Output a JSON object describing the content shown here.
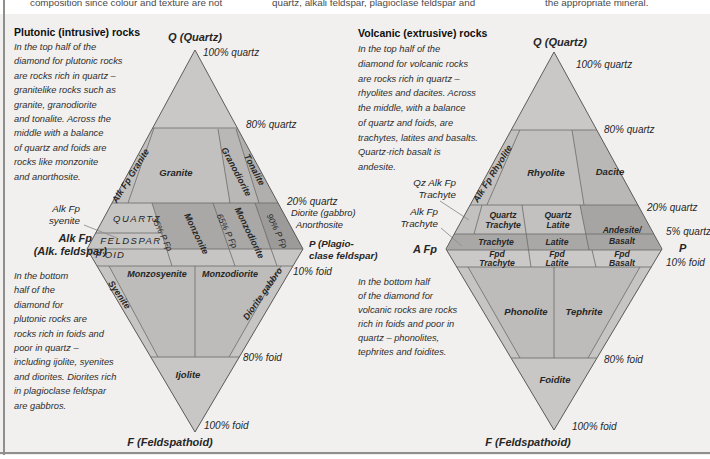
{
  "colors": {
    "figure_bg": "#f1f0ee",
    "diamond_base": "#c9c8c6",
    "top_band": "#c2c1bf",
    "cell_mid": "#b9b8b6",
    "cell_dark": "#b0afad",
    "band_light": "#c6c5c3",
    "band_dark": "#a9a8a6",
    "band_darkest": "#9c9b99",
    "andesite_cell": "#a6a5a3",
    "foot_row": "#cac9c7",
    "bottom_half": "#bdbcba",
    "edge_strip": "#c6c5c3",
    "apex_tri": "#c8c7c5"
  },
  "top_fragments": [
    {
      "n": "fragment-col1",
      "t": "composition since colour and texture are not",
      "x": 30,
      "y": 3,
      "s": 9.8,
      "i": false,
      "c": "#4a4a4a"
    },
    {
      "n": "fragment-col2",
      "t": "quartz, alkali feldspar, plagioclase feldspar and",
      "x": 272,
      "y": 3,
      "s": 9.8,
      "i": false,
      "c": "#4a4a4a"
    },
    {
      "n": "fragment-col3",
      "t": "the appropriate mineral.",
      "x": 545,
      "y": 3,
      "s": 9.8,
      "i": false,
      "c": "#4a4a4a"
    }
  ],
  "plutonic": {
    "texts": [
      {
        "n": "plutonic-heading",
        "t": "Plutonic (intrusive) rocks",
        "x": 14,
        "y": 32,
        "s": 10.5,
        "w": 700,
        "i": false,
        "c": "#0f0f0f"
      },
      {
        "n": "plutonic-intro-line-1",
        "t": "In the top half of the",
        "x": 14,
        "y": 48,
        "s": 9.3,
        "c": "#2e2e2e"
      },
      {
        "n": "plutonic-intro-line-2",
        "t": "diamond for plutonic rocks",
        "x": 14,
        "y": 62.4,
        "s": 9.3,
        "c": "#2e2e2e"
      },
      {
        "n": "plutonic-intro-line-3",
        "t": "are rocks rich in quartz –",
        "x": 14,
        "y": 76.8,
        "s": 9.3,
        "c": "#2e2e2e"
      },
      {
        "n": "plutonic-intro-line-4",
        "t": "granitelike rocks such as",
        "x": 14,
        "y": 91.2,
        "s": 9.3,
        "c": "#2e2e2e"
      },
      {
        "n": "plutonic-intro-line-5",
        "t": "granite, granodiorite",
        "x": 14,
        "y": 105.6,
        "s": 9.3,
        "c": "#2e2e2e"
      },
      {
        "n": "plutonic-intro-line-6",
        "t": "and tonalite. Across the",
        "x": 14,
        "y": 120,
        "s": 9.3,
        "c": "#2e2e2e"
      },
      {
        "n": "plutonic-intro-line-7",
        "t": "middle with a balance",
        "x": 14,
        "y": 134.4,
        "s": 9.3,
        "c": "#2e2e2e"
      },
      {
        "n": "plutonic-intro-line-8",
        "t": "of quartz and foids are",
        "x": 14,
        "y": 148.8,
        "s": 9.3,
        "c": "#2e2e2e"
      },
      {
        "n": "plutonic-intro-line-9",
        "t": "rocks like monzonite",
        "x": 14,
        "y": 163.2,
        "s": 9.3,
        "c": "#2e2e2e"
      },
      {
        "n": "plutonic-intro-line-10",
        "t": "and anorthosite.",
        "x": 14,
        "y": 177.6,
        "s": 9.3,
        "c": "#2e2e2e"
      },
      {
        "n": "plutonic-outro-line-1",
        "t": "In the bottom",
        "x": 14,
        "y": 277,
        "s": 9.3,
        "c": "#2e2e2e"
      },
      {
        "n": "plutonic-outro-line-2",
        "t": "half of the",
        "x": 14,
        "y": 291.4,
        "s": 9.3,
        "c": "#2e2e2e"
      },
      {
        "n": "plutonic-outro-line-3",
        "t": "diamond for",
        "x": 14,
        "y": 305.8,
        "s": 9.3,
        "c": "#2e2e2e"
      },
      {
        "n": "plutonic-outro-line-4",
        "t": "plutonic rocks are",
        "x": 14,
        "y": 320.2,
        "s": 9.3,
        "c": "#2e2e2e"
      },
      {
        "n": "plutonic-outro-line-5",
        "t": "rocks rich in foids and",
        "x": 14,
        "y": 334.6,
        "s": 9.3,
        "c": "#2e2e2e"
      },
      {
        "n": "plutonic-outro-line-6",
        "t": "poor in quartz –",
        "x": 14,
        "y": 349,
        "s": 9.3,
        "c": "#2e2e2e"
      },
      {
        "n": "plutonic-outro-line-7",
        "t": "including ijolite, syenites",
        "x": 14,
        "y": 363.4,
        "s": 9.3,
        "c": "#2e2e2e"
      },
      {
        "n": "plutonic-outro-line-8",
        "t": "and diorites. Diorites rich",
        "x": 14,
        "y": 377.8,
        "s": 9.3,
        "c": "#2e2e2e"
      },
      {
        "n": "plutonic-outro-line-9",
        "t": "in plagioclase feldspar",
        "x": 14,
        "y": 392.2,
        "s": 9.3,
        "c": "#2e2e2e"
      },
      {
        "n": "plutonic-outro-line-10",
        "t": "are gabbros.",
        "x": 14,
        "y": 406.6,
        "s": 9.3,
        "c": "#2e2e2e"
      },
      {
        "n": "plutonic-q-vertex-label",
        "t": "Q (Quartz)",
        "x": 195,
        "y": 37,
        "a": "center",
        "s": 11,
        "w": 700
      },
      {
        "n": "plutonic-100-quartz-label",
        "t": "100% quartz",
        "x": 203,
        "y": 53,
        "s": 10
      },
      {
        "n": "plutonic-80-quartz-label",
        "t": "80% quartz",
        "x": 246,
        "y": 125,
        "s": 10
      },
      {
        "n": "plutonic-20-quartz-label",
        "t": "20% quartz",
        "x": 287,
        "y": 202,
        "s": 10
      },
      {
        "n": "plutonic-diorite-gabbro-note",
        "t": "Diorite (gabbro)",
        "x": 291,
        "y": 214,
        "s": 9.3
      },
      {
        "n": "plutonic-anorthosite-note",
        "t": "Anorthosite",
        "x": 296,
        "y": 226,
        "s": 9.3
      },
      {
        "n": "plutonic-p-vertex-label-1",
        "t": "P (Plagio-",
        "x": 309,
        "y": 244,
        "s": 9.8,
        "w": 700
      },
      {
        "n": "plutonic-p-vertex-label-2",
        "t": "clase feldspar)",
        "x": 309,
        "y": 256,
        "s": 9.8,
        "w": 700
      },
      {
        "n": "plutonic-10-foid-label",
        "t": "10% foid",
        "x": 293,
        "y": 272,
        "s": 10
      },
      {
        "n": "plutonic-80-foid-label",
        "t": "80% foid",
        "x": 243,
        "y": 358,
        "s": 10
      },
      {
        "n": "plutonic-100-foid-label",
        "t": "100% foid",
        "x": 204,
        "y": 426,
        "s": 10
      },
      {
        "n": "plutonic-f-vertex-label",
        "t": "F (Feldspathoid)",
        "x": 170,
        "y": 442,
        "a": "center",
        "s": 11,
        "w": 700
      },
      {
        "n": "plutonic-alkfp-syenite-callout-1",
        "t": "Alk Fp",
        "x": 80,
        "y": 209,
        "a": "right",
        "s": 9.8
      },
      {
        "n": "plutonic-alkfp-syenite-callout-2",
        "t": "syenite",
        "x": 80,
        "y": 221,
        "a": "right",
        "s": 9.8
      },
      {
        "n": "plutonic-a-vertex-label-1",
        "t": "Alk Fp",
        "x": 92,
        "y": 238,
        "a": "right",
        "s": 11,
        "w": 700
      },
      {
        "n": "plutonic-a-vertex-label-2",
        "t": "(Alk. feldspar)",
        "x": 107,
        "y": 251,
        "a": "right",
        "s": 11,
        "w": 700
      },
      {
        "n": "plutonic-quartz-row-label",
        "t": "QUARTZ",
        "x": 137,
        "y": 219,
        "a": "center",
        "s": 9.5,
        "ls": 1.5
      },
      {
        "n": "plutonic-feldspar-row-label",
        "t": "FELDSPAR",
        "x": 131,
        "y": 241,
        "a": "center",
        "s": 9.5,
        "ls": 1.5
      },
      {
        "n": "plutonic-foid-row-label",
        "t": "F'OID",
        "x": 110,
        "y": 255,
        "a": "center",
        "s": 9.5,
        "ls": 1
      },
      {
        "n": "field-alk-fp-granite",
        "t": "Alk Fp Granite",
        "x": 131,
        "y": 176,
        "a": "center",
        "r": -58,
        "s": 9,
        "w": 700
      },
      {
        "n": "field-granite",
        "t": "Granite",
        "x": 176,
        "y": 173,
        "a": "center",
        "s": 9.5,
        "w": 700
      },
      {
        "n": "field-granodiorite",
        "t": "Granodiorite",
        "x": 236,
        "y": 172,
        "a": "center",
        "r": 62,
        "s": 9,
        "w": 700
      },
      {
        "n": "field-tonalite",
        "t": "Tonalite",
        "x": 254,
        "y": 170,
        "a": "center",
        "r": 62,
        "s": 9,
        "w": 700
      },
      {
        "n": "boundary-35-p-fp",
        "t": "35% P Fp",
        "x": 162,
        "y": 234,
        "a": "center",
        "r": 64,
        "s": 8.5
      },
      {
        "n": "field-monzonite",
        "t": "Monzonite",
        "x": 196,
        "y": 234,
        "a": "center",
        "r": 64,
        "s": 9,
        "w": 700
      },
      {
        "n": "boundary-65-p-fp",
        "t": "65% P Fp",
        "x": 227,
        "y": 231,
        "a": "center",
        "r": 64,
        "s": 8.5
      },
      {
        "n": "field-monzodiorite-band",
        "t": "Monzodiorite",
        "x": 249,
        "y": 233,
        "a": "center",
        "r": 64,
        "s": 9,
        "w": 700
      },
      {
        "n": "boundary-90-p-fp",
        "t": "90% P Fp",
        "x": 277,
        "y": 231,
        "a": "center",
        "r": 64,
        "s": 8.5
      },
      {
        "n": "field-syenite",
        "t": "Syenite",
        "x": 119,
        "y": 295,
        "a": "center",
        "r": 55,
        "s": 9,
        "w": 700
      },
      {
        "n": "field-monzosyenite",
        "t": "Monzosyenite",
        "x": 157,
        "y": 274,
        "a": "center",
        "s": 9,
        "w": 700
      },
      {
        "n": "field-monzodiorite-row",
        "t": "Monzodiorite",
        "x": 230,
        "y": 274,
        "a": "center",
        "s": 9,
        "w": 700
      },
      {
        "n": "field-diorite-gabbro",
        "t": "Diorite gabbro",
        "x": 263,
        "y": 294,
        "a": "center",
        "r": -55,
        "s": 9,
        "w": 700
      },
      {
        "n": "field-ijolite",
        "t": "Ijolite",
        "x": 188,
        "y": 375,
        "a": "center",
        "s": 9.5,
        "w": 700
      }
    ]
  },
  "volcanic": {
    "texts": [
      {
        "n": "volcanic-heading",
        "t": "Volcanic (extrusive) rocks",
        "x": 358,
        "y": 33,
        "s": 10.5,
        "w": 700,
        "i": false,
        "c": "#0f0f0f"
      },
      {
        "n": "volcanic-intro-line-1",
        "t": "In the top half of the",
        "x": 358,
        "y": 50,
        "s": 9.3,
        "c": "#2e2e2e"
      },
      {
        "n": "volcanic-intro-line-2",
        "t": "diamond for volcanic rocks",
        "x": 358,
        "y": 64.8,
        "s": 9.3,
        "c": "#2e2e2e"
      },
      {
        "n": "volcanic-intro-line-3",
        "t": "are rocks rich in quartz –",
        "x": 358,
        "y": 79.5,
        "s": 9.3,
        "c": "#2e2e2e"
      },
      {
        "n": "volcanic-intro-line-4",
        "t": "rhyolites and dacites. Across",
        "x": 358,
        "y": 94.3,
        "s": 9.3,
        "c": "#2e2e2e"
      },
      {
        "n": "volcanic-intro-line-5",
        "t": "the middle, with a balance",
        "x": 358,
        "y": 109,
        "s": 9.3,
        "c": "#2e2e2e"
      },
      {
        "n": "volcanic-intro-line-6",
        "t": "of quartz and foids, are",
        "x": 358,
        "y": 123.8,
        "s": 9.3,
        "c": "#2e2e2e"
      },
      {
        "n": "volcanic-intro-line-7",
        "t": "trachytes, latites and basalts.",
        "x": 358,
        "y": 138.5,
        "s": 9.3,
        "c": "#2e2e2e"
      },
      {
        "n": "volcanic-intro-line-8",
        "t": "Quartz-rich basalt is",
        "x": 358,
        "y": 153.3,
        "s": 9.3,
        "c": "#2e2e2e"
      },
      {
        "n": "volcanic-intro-line-9",
        "t": "andesite.",
        "x": 358,
        "y": 168,
        "s": 9.3,
        "c": "#2e2e2e"
      },
      {
        "n": "volcanic-outro-line-1",
        "t": "In the bottom half",
        "x": 358,
        "y": 283,
        "s": 9.3,
        "c": "#2e2e2e"
      },
      {
        "n": "volcanic-outro-line-2",
        "t": "of the diamond for",
        "x": 358,
        "y": 297,
        "s": 9.3,
        "c": "#2e2e2e"
      },
      {
        "n": "volcanic-outro-line-3",
        "t": "volcanic rocks are rocks",
        "x": 358,
        "y": 311,
        "s": 9.3,
        "c": "#2e2e2e"
      },
      {
        "n": "volcanic-outro-line-4",
        "t": "rich in foids and poor in",
        "x": 358,
        "y": 325,
        "s": 9.3,
        "c": "#2e2e2e"
      },
      {
        "n": "volcanic-outro-line-5",
        "t": "quartz – phonolites,",
        "x": 358,
        "y": 339,
        "s": 9.3,
        "c": "#2e2e2e"
      },
      {
        "n": "volcanic-outro-line-6",
        "t": "tephrites and foidites.",
        "x": 358,
        "y": 353,
        "s": 9.3,
        "c": "#2e2e2e"
      },
      {
        "n": "volcanic-q-vertex-label",
        "t": "Q (Quartz)",
        "x": 560,
        "y": 42,
        "a": "center",
        "s": 11,
        "w": 700
      },
      {
        "n": "volcanic-100-quartz-label",
        "t": "100% quartz",
        "x": 576,
        "y": 65,
        "s": 10
      },
      {
        "n": "volcanic-80-quartz-label",
        "t": "80% quartz",
        "x": 604,
        "y": 130,
        "s": 10
      },
      {
        "n": "volcanic-20-quartz-label",
        "t": "20% quartz",
        "x": 647,
        "y": 208,
        "s": 10
      },
      {
        "n": "volcanic-5-quartz-label",
        "t": "5% quartz",
        "x": 666,
        "y": 232,
        "s": 10
      },
      {
        "n": "volcanic-p-vertex-label",
        "t": "P",
        "x": 679,
        "y": 248,
        "s": 11,
        "w": 700
      },
      {
        "n": "volcanic-10-foid-label",
        "t": "10% foid",
        "x": 666,
        "y": 263,
        "s": 10
      },
      {
        "n": "volcanic-80-foid-label",
        "t": "80% foid",
        "x": 604,
        "y": 360,
        "s": 10
      },
      {
        "n": "volcanic-100-foid-label",
        "t": "100% foid",
        "x": 572,
        "y": 427,
        "s": 10
      },
      {
        "n": "volcanic-f-vertex-label",
        "t": "F (Feldspathoid)",
        "x": 528,
        "y": 442,
        "a": "center",
        "s": 11,
        "w": 700
      },
      {
        "n": "volcanic-qz-alk-fp-callout-1",
        "t": "Qz Alk Fp",
        "x": 456,
        "y": 183,
        "a": "right",
        "s": 9.8
      },
      {
        "n": "volcanic-qz-alk-fp-callout-2",
        "t": "Trachyte",
        "x": 456,
        "y": 195,
        "a": "right",
        "s": 9.8
      },
      {
        "n": "volcanic-alk-fp-callout-1",
        "t": "Alk Fp",
        "x": 438,
        "y": 212,
        "a": "right",
        "s": 9.8
      },
      {
        "n": "volcanic-alk-fp-callout-2",
        "t": "Trachyte",
        "x": 438,
        "y": 224,
        "a": "right",
        "s": 9.8
      },
      {
        "n": "volcanic-a-vertex-label",
        "t": "A Fp",
        "x": 437,
        "y": 249,
        "a": "right",
        "s": 11,
        "w": 700
      },
      {
        "n": "field-alk-fp-rhyolite",
        "t": "Alk Fp Rhyolite",
        "x": 493,
        "y": 174,
        "a": "center",
        "r": -58,
        "s": 9,
        "w": 700
      },
      {
        "n": "field-rhyolite",
        "t": "Rhyolite",
        "x": 546,
        "y": 173,
        "a": "center",
        "s": 9.5,
        "w": 700
      },
      {
        "n": "field-dacite",
        "t": "Dacite",
        "x": 610,
        "y": 172,
        "a": "center",
        "s": 9.5,
        "w": 700
      },
      {
        "n": "field-quartz-trachyte-1",
        "t": "Quartz",
        "x": 503,
        "y": 215,
        "a": "center",
        "s": 8.6,
        "w": 700
      },
      {
        "n": "field-quartz-trachyte-2",
        "t": "Trachyte",
        "x": 503,
        "y": 225,
        "a": "center",
        "s": 8.6,
        "w": 700
      },
      {
        "n": "field-quartz-latite-1",
        "t": "Quartz",
        "x": 558,
        "y": 215,
        "a": "center",
        "s": 8.6,
        "w": 700
      },
      {
        "n": "field-quartz-latite-2",
        "t": "Latite",
        "x": 558,
        "y": 225,
        "a": "center",
        "s": 8.6,
        "w": 700
      },
      {
        "n": "field-andesite-basalt-1",
        "t": "Andesite/",
        "x": 622,
        "y": 230,
        "a": "center",
        "s": 8.6,
        "w": 700
      },
      {
        "n": "field-andesite-basalt-2",
        "t": "Basalt",
        "x": 622,
        "y": 241,
        "a": "center",
        "s": 8.6,
        "w": 700
      },
      {
        "n": "field-trachyte",
        "t": "Trachyte",
        "x": 496,
        "y": 242,
        "a": "center",
        "s": 8.6,
        "w": 700
      },
      {
        "n": "field-latite",
        "t": "Latite",
        "x": 557,
        "y": 242,
        "a": "center",
        "s": 8.6,
        "w": 700
      },
      {
        "n": "field-fpd-trachyte-1",
        "t": "Fpd",
        "x": 497,
        "y": 254,
        "a": "center",
        "s": 8.6,
        "w": 700
      },
      {
        "n": "field-fpd-trachyte-2",
        "t": "Trachyte",
        "x": 497,
        "y": 262.5,
        "a": "center",
        "s": 8.6,
        "w": 700
      },
      {
        "n": "field-fpd-latite-1",
        "t": "Fpd",
        "x": 557,
        "y": 254,
        "a": "center",
        "s": 8.6,
        "w": 700
      },
      {
        "n": "field-fpd-latite-2",
        "t": "Latite",
        "x": 557,
        "y": 262.5,
        "a": "center",
        "s": 8.6,
        "w": 700
      },
      {
        "n": "field-fpd-basalt-1",
        "t": "Fpd",
        "x": 622,
        "y": 254,
        "a": "center",
        "s": 8.6,
        "w": 700
      },
      {
        "n": "field-fpd-basalt-2",
        "t": "Basalt",
        "x": 622,
        "y": 262.5,
        "a": "center",
        "s": 8.6,
        "w": 700
      },
      {
        "n": "field-phonolite",
        "t": "Phonolite",
        "x": 526,
        "y": 312,
        "a": "center",
        "s": 9.5,
        "w": 700
      },
      {
        "n": "field-tephrite",
        "t": "Tephrite",
        "x": 584,
        "y": 312,
        "a": "center",
        "s": 9.5,
        "w": 700
      },
      {
        "n": "field-foidite",
        "t": "Foidite",
        "x": 555,
        "y": 380,
        "a": "center",
        "s": 9.5,
        "w": 700
      }
    ]
  }
}
